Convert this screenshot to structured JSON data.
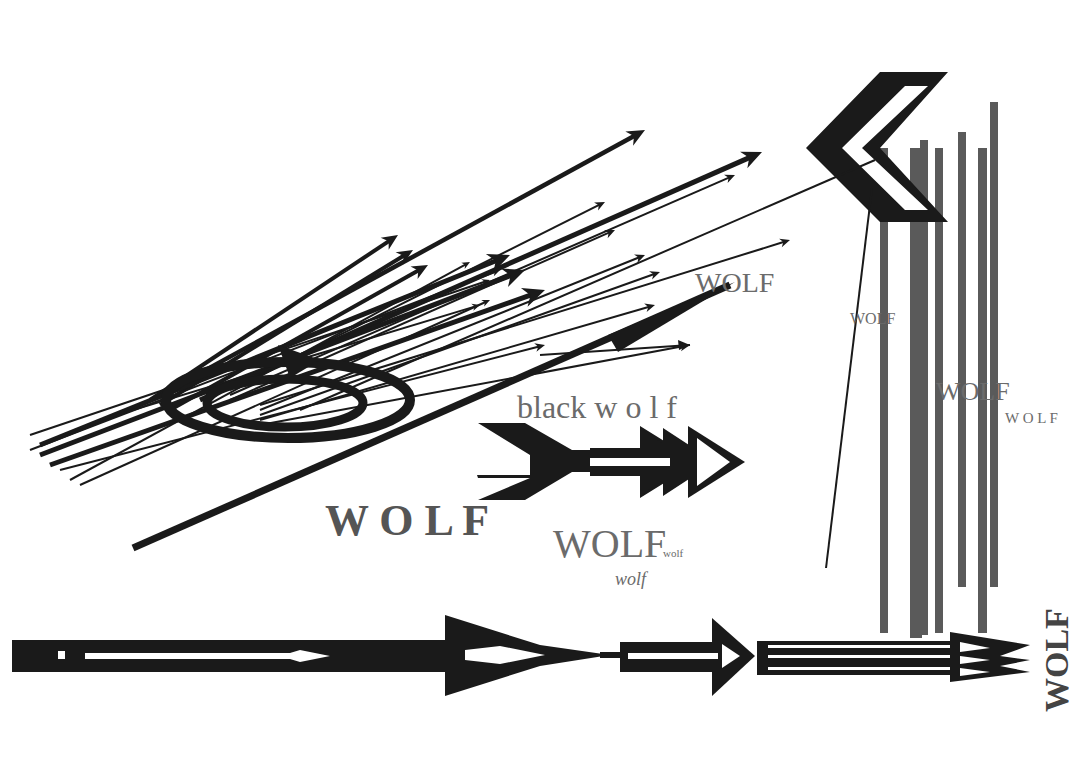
{
  "artwork": {
    "background": "#ffffff",
    "ink": "#1a1a1a",
    "grey": "#666666",
    "bar_grey": "#5a5a5a"
  },
  "texts": {
    "wolf_top_right": "WOLF",
    "wolf_small_mid": "WOLF",
    "wolf_bars_big": "WOLF",
    "wolf_bars_spaced": "W O L F",
    "black_wolf": "black w o l f",
    "wolf_bold_spaced": "W O L F",
    "wolf_center_big": "WOLF",
    "wolf_subscript": "wolf",
    "wolf_below": "wolf",
    "wolf_vertical": "WOLF"
  },
  "shapes": {
    "fan_arrows": [
      {
        "x1": 160,
        "y1": 395,
        "x2": 645,
        "y2": 130,
        "w": 4.5,
        "head": 18
      },
      {
        "x1": 150,
        "y1": 400,
        "x2": 398,
        "y2": 235,
        "w": 4,
        "head": 16
      },
      {
        "x1": 160,
        "y1": 405,
        "x2": 413,
        "y2": 250,
        "w": 4,
        "head": 16
      },
      {
        "x1": 170,
        "y1": 410,
        "x2": 428,
        "y2": 265,
        "w": 4,
        "head": 16
      },
      {
        "x1": 200,
        "y1": 400,
        "x2": 762,
        "y2": 152,
        "w": 5,
        "head": 20
      },
      {
        "x1": 230,
        "y1": 395,
        "x2": 735,
        "y2": 175,
        "w": 2,
        "head": 10
      },
      {
        "x1": 230,
        "y1": 390,
        "x2": 605,
        "y2": 202,
        "w": 2,
        "head": 10
      },
      {
        "x1": 230,
        "y1": 400,
        "x2": 615,
        "y2": 230,
        "w": 2,
        "head": 10
      },
      {
        "x1": 260,
        "y1": 405,
        "x2": 790,
        "y2": 240,
        "w": 2,
        "head": 10
      },
      {
        "x1": 260,
        "y1": 410,
        "x2": 645,
        "y2": 255,
        "w": 2,
        "head": 10
      },
      {
        "x1": 260,
        "y1": 415,
        "x2": 660,
        "y2": 272,
        "w": 2,
        "head": 10
      },
      {
        "x1": 260,
        "y1": 420,
        "x2": 655,
        "y2": 305,
        "w": 2,
        "head": 10
      },
      {
        "x1": 260,
        "y1": 425,
        "x2": 690,
        "y2": 345,
        "w": 2,
        "head": 10
      },
      {
        "x1": 40,
        "y1": 445,
        "x2": 510,
        "y2": 255,
        "w": 5,
        "head": 22
      },
      {
        "x1": 40,
        "y1": 455,
        "x2": 525,
        "y2": 270,
        "w": 5,
        "head": 22
      },
      {
        "x1": 50,
        "y1": 465,
        "x2": 545,
        "y2": 290,
        "w": 5,
        "head": 22
      },
      {
        "x1": 30,
        "y1": 450,
        "x2": 500,
        "y2": 270,
        "w": 2,
        "head": 8
      },
      {
        "x1": 30,
        "y1": 435,
        "x2": 490,
        "y2": 280,
        "w": 2,
        "head": 8
      },
      {
        "x1": 60,
        "y1": 470,
        "x2": 545,
        "y2": 345,
        "w": 2,
        "head": 10
      },
      {
        "x1": 70,
        "y1": 480,
        "x2": 470,
        "y2": 262,
        "w": 2,
        "head": 8
      },
      {
        "x1": 80,
        "y1": 485,
        "x2": 490,
        "y2": 300,
        "w": 2,
        "head": 8
      },
      {
        "x1": 100,
        "y1": 420,
        "x2": 480,
        "y2": 305,
        "w": 2,
        "head": 8
      },
      {
        "x1": 300,
        "y1": 410,
        "x2": 875,
        "y2": 160,
        "w": 2,
        "head": 0
      }
    ],
    "big_diagonal": {
      "x1": 133,
      "y1": 548,
      "x2": 730,
      "y2": 285,
      "w": 7
    },
    "chevron": {
      "outer": "880,72 948,72 880,148 948,222 880,222 806,148",
      "inner": "905,86 928,86 862,148 928,210 905,210 842,148"
    },
    "thin_line": {
      "x1": 872,
      "y1": 188,
      "x2": 826,
      "y2": 568
    },
    "bars": [
      {
        "x": 880,
        "y": 148,
        "w": 8,
        "h": 485
      },
      {
        "x": 910,
        "y": 148,
        "w": 12,
        "h": 490
      },
      {
        "x": 920,
        "y": 140,
        "w": 8,
        "h": 495
      },
      {
        "x": 935,
        "y": 148,
        "w": 8,
        "h": 485
      },
      {
        "x": 958,
        "y": 132,
        "w": 8,
        "h": 455
      },
      {
        "x": 978,
        "y": 148,
        "w": 9,
        "h": 485
      },
      {
        "x": 990,
        "y": 102,
        "w": 8,
        "h": 485
      }
    ]
  }
}
